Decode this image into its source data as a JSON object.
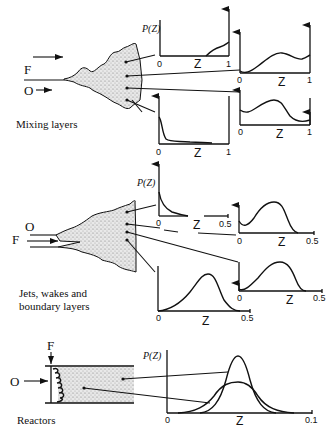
{
  "figure": {
    "colors": {
      "ink": "#111111",
      "background": "#ffffff",
      "stipple": "#9a9a9a"
    }
  },
  "mixing_layers": {
    "caption": "Mixing layers",
    "stream_top": "F",
    "stream_bottom": "O",
    "plots": [
      {
        "id": "ml-top",
        "ylabel": "P(Z)",
        "xlabel": "Z",
        "x0": "0",
        "x1": "1",
        "shape": "rising near Z=1 with delta spike at 1"
      },
      {
        "id": "ml-mid-upper",
        "ylabel": "",
        "xlabel": "Z",
        "x0": "0",
        "x1": "1",
        "shape": "deltas at 0 and 1 with broad hump"
      },
      {
        "id": "ml-mid-lower",
        "ylabel": "",
        "xlabel": "Z",
        "x0": "0",
        "x1": "1",
        "shape": "deltas at 0 and 1 with hump near 0.35"
      },
      {
        "id": "ml-bottom",
        "ylabel": "",
        "xlabel": "Z",
        "x0": "0",
        "x1": "1",
        "shape": "delta at 0 with decaying tail"
      }
    ]
  },
  "jets": {
    "caption_line1": "Jets, wakes and",
    "caption_line2": "boundary layers",
    "stream_outer": "O",
    "stream_inner": "F",
    "plots": [
      {
        "id": "jet-top",
        "ylabel": "P(Z)",
        "xlabel": "Z",
        "x0": "0",
        "x1": "0.5",
        "shape": "delta at 0 with decaying tail"
      },
      {
        "id": "jet-mid",
        "ylabel": "",
        "xlabel": "Z",
        "x0": "0",
        "x1": "0.5",
        "shape": "delta at 0 with hump near 0.3"
      },
      {
        "id": "jet-lower-right",
        "ylabel": "",
        "xlabel": "Z",
        "x0": "0",
        "x1": "0.5",
        "shape": "small delta at 0 with broad hump near 0.25"
      },
      {
        "id": "jet-bottom",
        "ylabel": "",
        "xlabel": "Z",
        "x0": "0",
        "x1": "0.5",
        "shape": "single hump near 0.3"
      }
    ]
  },
  "reactors": {
    "caption": "Reactors",
    "stream_top": "F",
    "stream_side": "O",
    "plot": {
      "ylabel": "P(Z)",
      "xlabel": "Z",
      "x0": "0",
      "x1": "0.1",
      "shape": "two Gaussian-like curves centered near Z=0.05, one narrow/tall, one broad/short"
    }
  }
}
